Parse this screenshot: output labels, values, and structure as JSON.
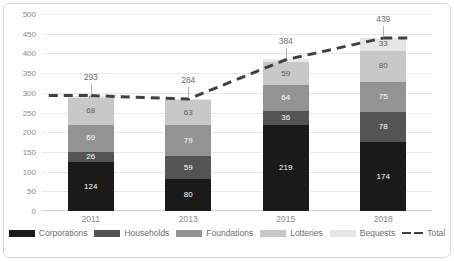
{
  "chart_data": {
    "type": "bar",
    "subtype": "stacked-bar-with-line",
    "title": "",
    "subtitle": "",
    "xlabel": "",
    "ylabel": "",
    "categories": [
      "2011",
      "2013",
      "2015",
      "2018"
    ],
    "ylim": [
      0,
      500
    ],
    "yticks": [
      0,
      50,
      100,
      150,
      200,
      250,
      300,
      350,
      400,
      450,
      500
    ],
    "ytick_labels": [
      "0",
      "50",
      "100",
      "150",
      "200",
      "250",
      "300",
      "350",
      "400",
      "450",
      "500"
    ],
    "grid": true,
    "grid_axis": "y",
    "legend_position": "bottom",
    "series": [
      {
        "name": "Corporations",
        "type": "bar",
        "color": "#1a1a1a",
        "label_color": "#ffffff",
        "values": [
          124,
          80,
          219,
          174
        ]
      },
      {
        "name": "Households",
        "type": "bar",
        "color": "#545454",
        "label_color": "#ffffff",
        "values": [
          26,
          59,
          36,
          78
        ]
      },
      {
        "name": "Foundations",
        "type": "bar",
        "color": "#939393",
        "label_color": "#ffffff",
        "values": [
          69,
          79,
          64,
          75
        ]
      },
      {
        "name": "Lotteries",
        "type": "bar",
        "color": "#c8c8c8",
        "label_color": "#595959",
        "values": [
          68,
          63,
          59,
          80
        ]
      },
      {
        "name": "Bequests",
        "type": "bar",
        "color": "#e6e6e6",
        "label_color": "#595959",
        "values": [
          6,
          3,
          7,
          33
        ]
      },
      {
        "name": "Total",
        "type": "line",
        "color": "#404040",
        "style": "dashed",
        "values": [
          293,
          284,
          384,
          439
        ]
      }
    ],
    "total_labels": [
      "293",
      "284",
      "384",
      "439"
    ],
    "bar_labels": [
      [
        "124",
        "26",
        "69",
        "68",
        "6"
      ],
      [
        "80",
        "59",
        "79",
        "63",
        "3"
      ],
      [
        "219",
        "36",
        "64",
        "59",
        "7"
      ],
      [
        "174",
        "78",
        "75",
        "80",
        "33"
      ]
    ]
  },
  "legend": {
    "items": [
      {
        "label": "Corporations",
        "color": "#1a1a1a"
      },
      {
        "label": "Households",
        "color": "#545454"
      },
      {
        "label": "Foundations",
        "color": "#939393"
      },
      {
        "label": "Lotteries",
        "color": "#c8c8c8"
      },
      {
        "label": "Bequests",
        "color": "#e6e6e6"
      },
      {
        "label": "Total",
        "color": "#404040"
      }
    ]
  },
  "colors": {
    "grid": "#e8e8e8",
    "axis_text": "#8a8a8a",
    "frame": "#d9d9d9",
    "background": "#ffffff"
  }
}
